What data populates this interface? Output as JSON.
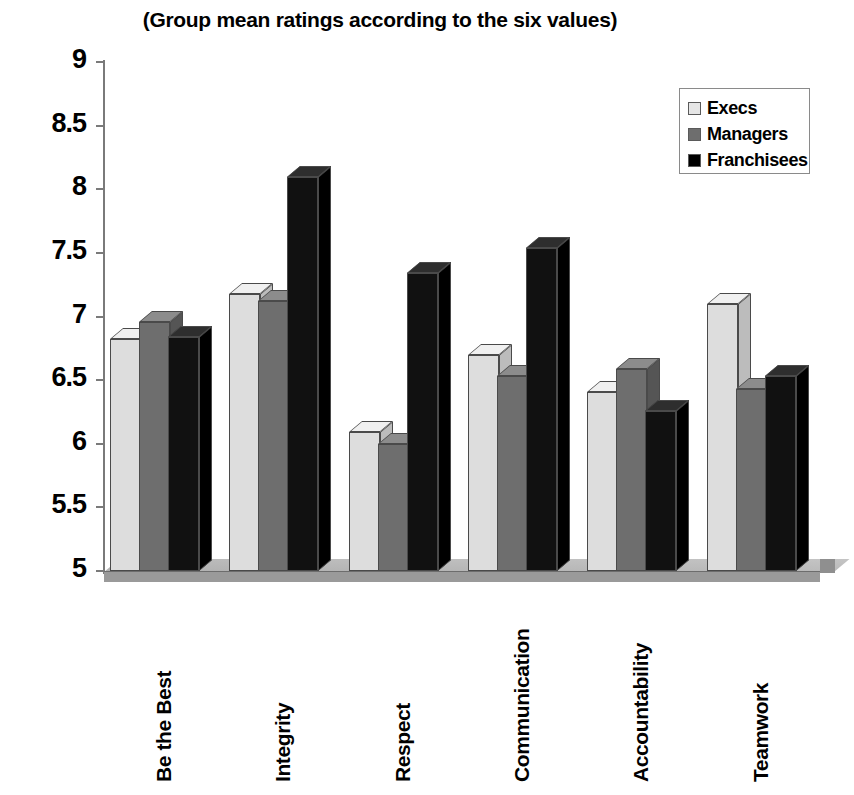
{
  "chart_data": {
    "type": "bar",
    "title": "(Group mean ratings according to the six values)",
    "xlabel": "",
    "ylabel": "",
    "ylim": [
      5,
      9
    ],
    "ytick_step": 0.5,
    "yticks": [
      "9",
      "8.5",
      "8",
      "7.5",
      "7",
      "6.5",
      "6",
      "5.5",
      "5"
    ],
    "grid": false,
    "legend_position": "top-right",
    "style_3d": true,
    "categories": [
      "Be the Best",
      "Integrity",
      "Respect",
      "Communication",
      "Accountability",
      "Teamwork"
    ],
    "series": [
      {
        "name": "Execs",
        "color": "#dddddd",
        "values": [
          6.82,
          7.18,
          6.09,
          6.7,
          6.41,
          7.1
        ]
      },
      {
        "name": "Managers",
        "color": "#6e6e6e",
        "values": [
          6.96,
          7.12,
          6.0,
          6.53,
          6.59,
          6.43
        ]
      },
      {
        "name": "Franchisees",
        "color": "#111111",
        "values": [
          6.84,
          8.1,
          7.34,
          7.54,
          6.26,
          6.53
        ]
      }
    ]
  },
  "legend": {
    "items": [
      {
        "label": "Execs"
      },
      {
        "label": "Managers"
      },
      {
        "label": "Franchisees"
      }
    ]
  }
}
